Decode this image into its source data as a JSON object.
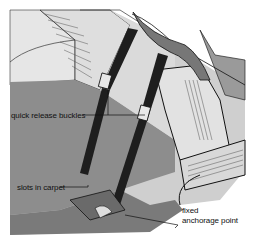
{
  "diagram": {
    "labels": [
      {
        "id": "buckles",
        "text": "quick release buckles"
      },
      {
        "id": "slots",
        "text": "slots in carpet"
      },
      {
        "id": "anchor_line1",
        "text": "fixed"
      },
      {
        "id": "anchor_line2",
        "text": "anchorage point"
      }
    ],
    "colors": {
      "background": "#ffffff",
      "seat_light": "#d9d9d9",
      "seat_shade": "#bdbdbd",
      "floor": "#8a8a8a",
      "floor_dark": "#6f6f6f",
      "strap": "#1e1e1e",
      "outline": "#111111"
    }
  }
}
